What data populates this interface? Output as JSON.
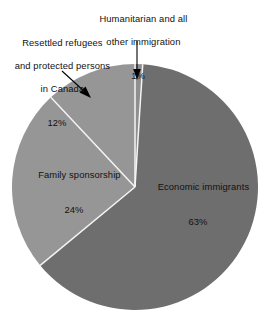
{
  "chart_data": {
    "type": "pie",
    "title": "",
    "subtitle": "",
    "xlabel": "",
    "ylabel": "",
    "legend_position": "none",
    "labels_position": "callout-and-inside",
    "grid": false,
    "units": "percent",
    "total": 100,
    "categories": [
      "Economic immigrants",
      "Family sponsorship",
      "Resettled refugees and protected persons in Canada",
      "Humanitarian and all other immigration"
    ],
    "values": [
      63,
      24,
      12,
      1
    ],
    "slices": [
      {
        "name": "economic",
        "label": "Economic immigrants",
        "value_text": "63%",
        "value": 63,
        "color": "#6e6e6e",
        "label_placement": "inside"
      },
      {
        "name": "family",
        "label": "Family sponsorship",
        "value_text": "24%",
        "value": 24,
        "color": "#969696",
        "label_placement": "inside"
      },
      {
        "name": "refugees",
        "label_line_1": "Resettled refugees",
        "label_line_2": "and protected persons",
        "label_line_3": "in Canada",
        "value_text": "12%",
        "value": 12,
        "color": "#969696",
        "label_placement": "callout"
      },
      {
        "name": "humanitarian",
        "label_line_1": "Humanitarian and all",
        "label_line_2": "other immigration",
        "value_text": "1%",
        "value": 1,
        "color": "#8f8f8f",
        "label_placement": "callout"
      }
    ],
    "colors": {
      "background": "#ffffff",
      "slice_dark": "#6e6e6e",
      "slice_light": "#969696",
      "slice_sliver": "#8f8f8f",
      "separator": "#f2f2f2",
      "text": "#111111",
      "leader": "#000000"
    },
    "geometry": {
      "center_x": 135,
      "center_y": 187,
      "radius": 123,
      "start_angle_deg": 0,
      "direction": "clockwise"
    }
  }
}
